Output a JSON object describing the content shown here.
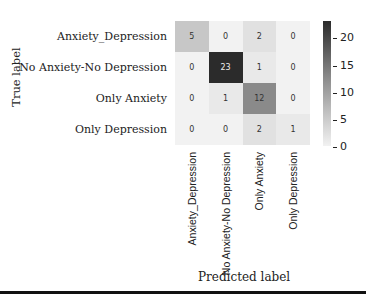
{
  "chart_data": {
    "type": "heatmap",
    "title": "",
    "xlabel": "Predicted label",
    "ylabel": "True label",
    "x_categories": [
      "Anxiety_Depression",
      "No Anxiety-No Depression",
      "Only Anxiety",
      "Only Depression"
    ],
    "y_categories": [
      "Anxiety_Depression",
      "No Anxiety-No Depression",
      "Only Anxiety",
      "Only Depression"
    ],
    "values": [
      [
        5,
        0,
        2,
        0
      ],
      [
        0,
        23,
        1,
        0
      ],
      [
        0,
        1,
        12,
        0
      ],
      [
        0,
        0,
        2,
        1
      ]
    ],
    "colorbar": {
      "min": 0,
      "max": 23,
      "ticks": [
        "0",
        "5",
        "10",
        "15",
        "20"
      ]
    },
    "colormap": "Greys"
  }
}
